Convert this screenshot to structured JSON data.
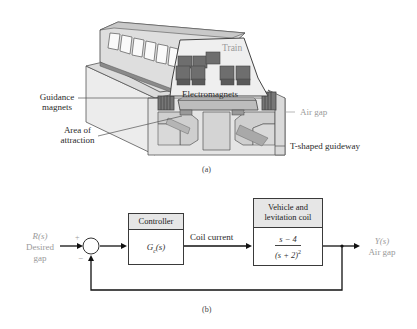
{
  "figure_a": {
    "caption": "(a)",
    "labels": {
      "train": "Train",
      "electromagnets": "Electromagnets",
      "guidance_magnets_line1": "Guidance",
      "guidance_magnets_line2": "magnets",
      "area_line1": "Area of",
      "area_line2": "attraction",
      "air_gap": "Air gap",
      "guideway": "T-shaped guideway"
    }
  },
  "figure_b": {
    "caption": "(b)",
    "input": {
      "signal": "R(s)",
      "line1": "Desired",
      "line2": "gap"
    },
    "summing_junction": {
      "plus": "+",
      "minus": "−"
    },
    "controller": {
      "header": "Controller",
      "tf_main": "G",
      "tf_sub": "c",
      "tf_arg": "(s)"
    },
    "edge_label": "Coil current",
    "plant": {
      "header_line1": "Vehicle and",
      "header_line2": "levitation coil",
      "numerator": "s − 4",
      "denominator": "(s + 2)",
      "denominator_exp": "2"
    },
    "output": {
      "signal": "Y(s)",
      "label": "Air gap"
    }
  }
}
